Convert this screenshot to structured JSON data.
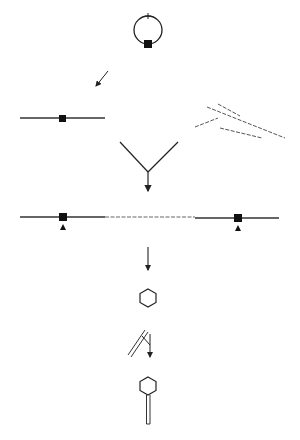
{
  "diagram": {
    "title": "",
    "stroke_color": "#222222",
    "dashed_color": "#555555",
    "background": "#ffffff",
    "steps": [
      {
        "id": "circular-molecule",
        "description": "circle with a marker square at bottom and a small tick at top"
      },
      {
        "id": "linearization-arrow",
        "description": "diagonal arrow pointing down-left"
      },
      {
        "id": "linear-molecule",
        "description": "horizontal line with a square marker"
      },
      {
        "id": "fragments",
        "description": "several dashed fragment lines"
      },
      {
        "id": "convergence",
        "description": "Y-shaped merge with downward arrow"
      },
      {
        "id": "joined-molecule",
        "description": "long line with a dashed middle segment and two square markers with arrowheads below"
      },
      {
        "id": "step-arrow",
        "description": "downward arrow"
      },
      {
        "id": "hexagon",
        "description": "hexagon"
      },
      {
        "id": "rod-and-merge",
        "description": "double-line rod and small Y-shaped arrow"
      },
      {
        "id": "hexagon-with-tail",
        "description": "hexagon attached to double-line rod"
      }
    ]
  }
}
